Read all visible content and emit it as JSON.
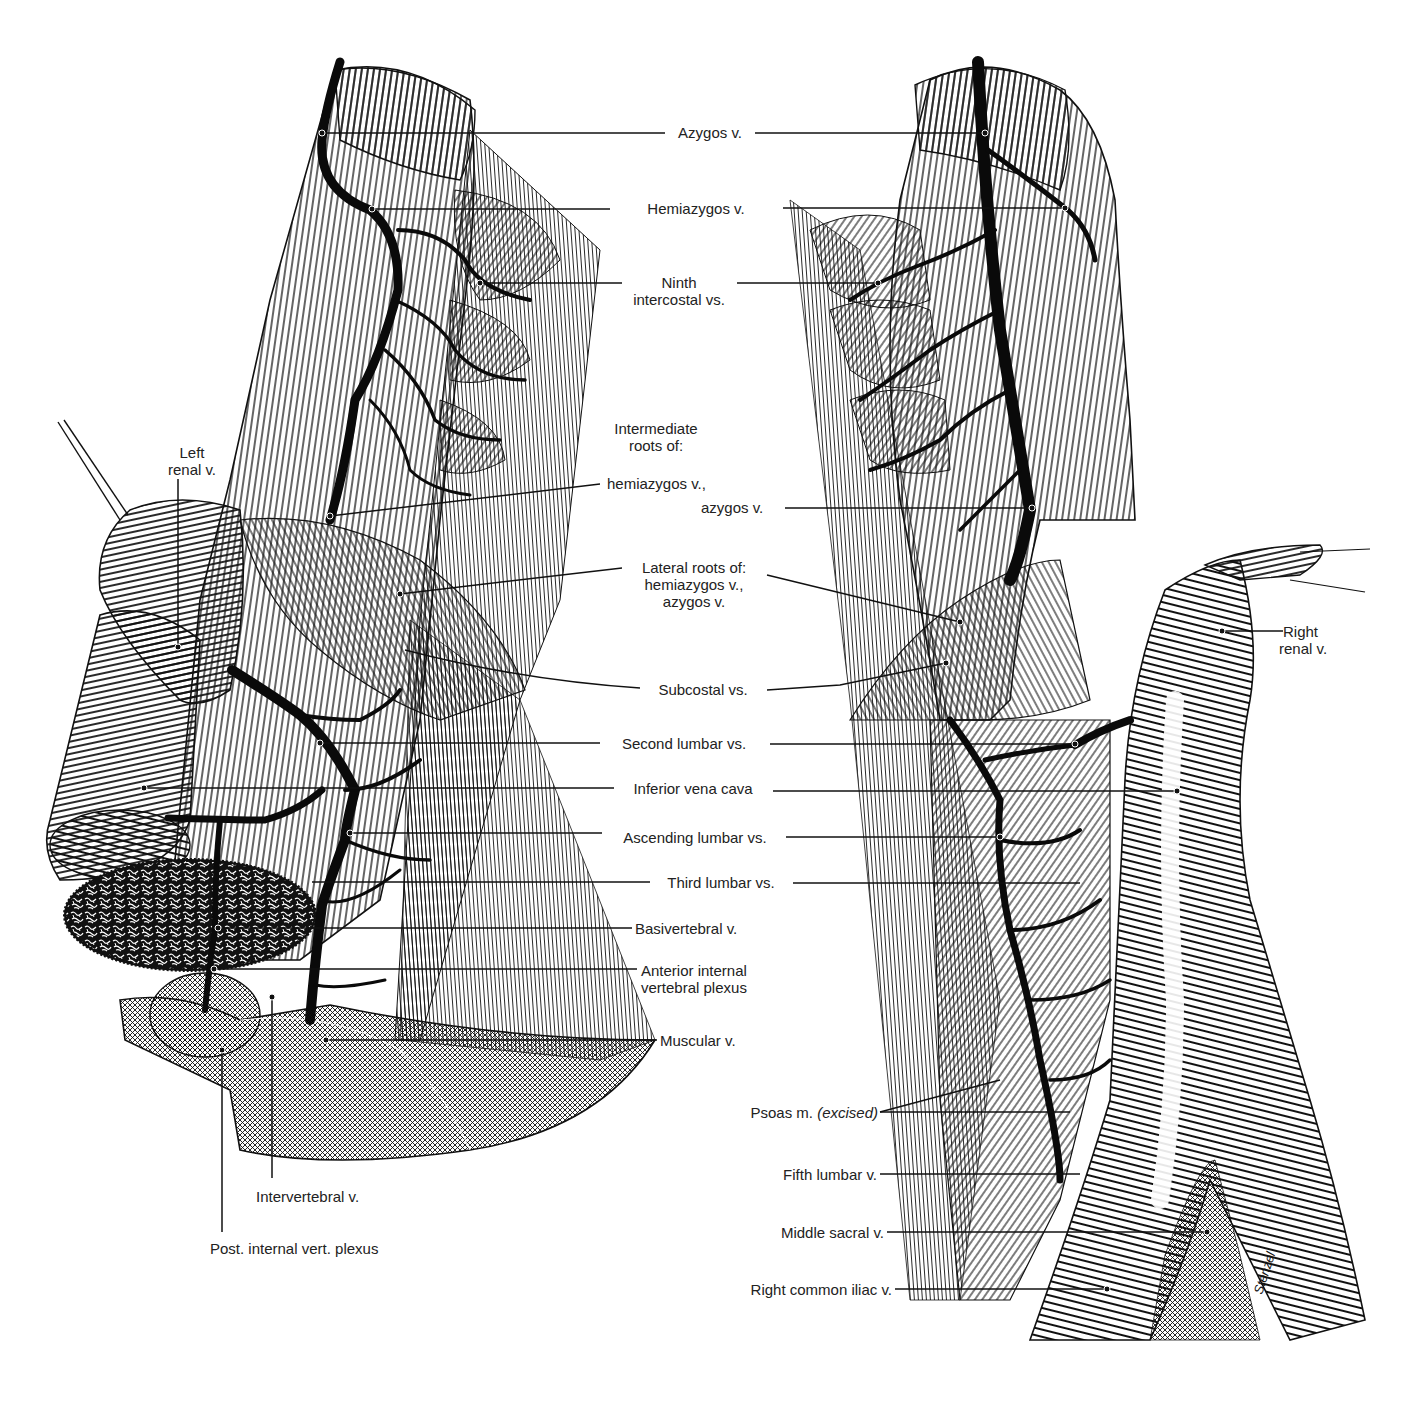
{
  "figure": {
    "type": "anatomical-illustration",
    "colors": {
      "ink": "#111111",
      "paper": "#ffffff",
      "label": "#222222"
    }
  },
  "labels": {
    "azygos": "Azygos v.",
    "hemiazygos": "Hemiazygos v.",
    "ninth_1": "Ninth",
    "ninth_2": "intercostal vs.",
    "intermediate_1": "Intermediate",
    "intermediate_2": "roots of:",
    "intermediate_hemi": "hemiazygos v.,",
    "intermediate_azygos": "azygos v.",
    "lateral_1": "Lateral roots of:",
    "lateral_2": "hemiazygos v.,",
    "lateral_3": "azygos v.",
    "subcostal": "Subcostal vs.",
    "second_lumbar": "Second lumbar vs.",
    "ivc": "Inferior vena cava",
    "ascending_lumbar": "Ascending lumbar vs.",
    "third_lumbar": "Third lumbar vs.",
    "basivertebral": "Basivertebral v.",
    "anterior_plexus_1": "Anterior internal",
    "anterior_plexus_2": "vertebral plexus",
    "muscular": "Muscular v.",
    "left_renal_1": "Left",
    "left_renal_2": "renal v.",
    "right_renal_1": "Right",
    "right_renal_2": "renal v.",
    "psoas": "Psoas m.",
    "psoas_note": "(excised)",
    "fifth_lumbar": "Fifth lumbar v.",
    "middle_sacral": "Middle sacral v.",
    "right_common_iliac": "Right common iliac v.",
    "intervertebral": "Intervertebral v.",
    "post_plexus": "Post. internal vert. plexus",
    "signature": "Stenzel"
  }
}
